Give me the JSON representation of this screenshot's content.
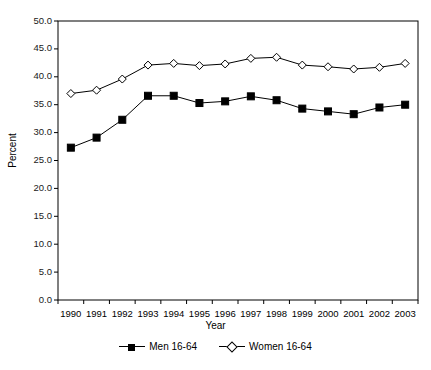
{
  "chart_data": {
    "type": "line",
    "title": "",
    "xlabel": "Year",
    "ylabel": "Percent",
    "categories": [
      "1990",
      "1991",
      "1992",
      "1993",
      "1994",
      "1995",
      "1996",
      "1997",
      "1998",
      "1999",
      "2000",
      "2001",
      "2002",
      "2003"
    ],
    "ylim": [
      0.0,
      50.0
    ],
    "ytick_step": 5.0,
    "ytick_labels": [
      "0.0",
      "5.0",
      "10.0",
      "15.0",
      "20.0",
      "25.0",
      "30.0",
      "35.0",
      "40.0",
      "45.0",
      "50.0"
    ],
    "grid": false,
    "legend_position": "bottom",
    "series": [
      {
        "name": "Men 16-64",
        "marker": "filled-square",
        "color": "#000000",
        "values": [
          27.3,
          29.1,
          32.3,
          36.6,
          36.6,
          35.3,
          35.6,
          36.5,
          35.8,
          34.3,
          33.8,
          33.3,
          34.5,
          35.0
        ]
      },
      {
        "name": "Women 16-64",
        "marker": "open-diamond",
        "color": "#000000",
        "values": [
          37.0,
          37.6,
          39.6,
          42.1,
          42.4,
          42.0,
          42.3,
          43.3,
          43.5,
          42.1,
          41.8,
          41.4,
          41.7,
          42.4
        ]
      }
    ]
  }
}
